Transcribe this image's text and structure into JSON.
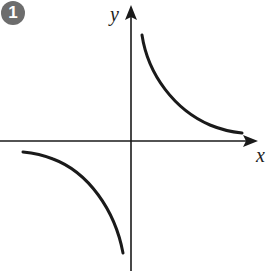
{
  "figure": {
    "badge": "1",
    "axes": {
      "x_label": "x",
      "y_label": "y"
    },
    "colors": {
      "stroke": "#1a1a1a",
      "badge_bg": "#6d6d6d"
    }
  },
  "diagram": {
    "type": "function-graph",
    "branches": [
      {
        "quadrant": "I",
        "from": [
          142,
          35
        ],
        "to": [
          242,
          133
        ]
      },
      {
        "quadrant": "III",
        "from": [
          23,
          152
        ],
        "to": [
          123,
          253
        ]
      }
    ]
  }
}
